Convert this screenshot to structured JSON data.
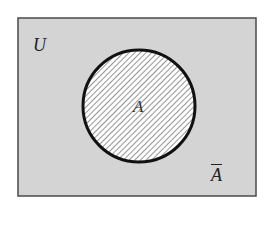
{
  "diagram": {
    "type": "venn",
    "universe": {
      "label": "U",
      "fill": "#d4d4d4",
      "stroke": "#4a4a4a",
      "x": 18,
      "y": 18,
      "width": 238,
      "height": 178
    },
    "set_a": {
      "label": "A",
      "fill": "#ffffff",
      "hatch_color": "#7a7a7a",
      "stroke": "#111111",
      "cx": 139,
      "cy": 106,
      "r": 56
    },
    "complement": {
      "label": "A",
      "overline": true,
      "description": "complement of A"
    }
  }
}
